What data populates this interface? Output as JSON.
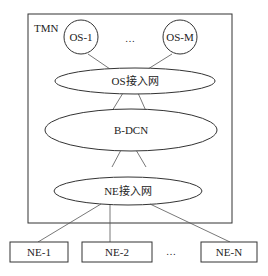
{
  "diagram": {
    "container": {
      "label": "TMN"
    },
    "os_nodes": [
      {
        "label": "OS-1"
      },
      {
        "label": "OS-M"
      }
    ],
    "os_ellipsis": "…",
    "os_access_network": {
      "label": "OS接入网"
    },
    "bdcn": {
      "label": "B-DCN"
    },
    "ne_access_network": {
      "label": "NE接入网"
    },
    "ne_nodes": [
      {
        "label": "NE-1"
      },
      {
        "label": "NE-2"
      },
      {
        "label": "NE-N"
      }
    ],
    "ne_ellipsis": "…",
    "colors": {
      "stroke": "#333333",
      "background": "#ffffff"
    }
  }
}
